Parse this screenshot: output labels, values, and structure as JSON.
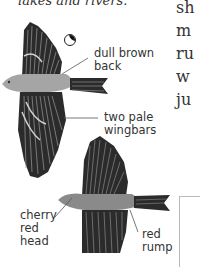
{
  "page": {
    "caption_fragment": "lakes and rivers.",
    "body_text_lines": [
      "sh",
      "m",
      "ru",
      "w",
      "ju"
    ]
  },
  "illustrations": [
    {
      "subject": "bird-in-flight-upper",
      "labels": [
        "dull brown back",
        "two pale wingbars"
      ],
      "icon": "moon-phase-icon"
    },
    {
      "subject": "bird-in-flight-lower",
      "labels": [
        "cherry red head",
        "red rump"
      ]
    }
  ],
  "labels": {
    "dull_brown_back": [
      "dull brown",
      "back"
    ],
    "two_pale_wingbars": [
      "two pale",
      "wingbars"
    ],
    "cherry_red_head": [
      "cherry",
      "red",
      "head"
    ],
    "red_rump": [
      "red",
      "rump"
    ]
  },
  "colors": {
    "wing_dark": "#2b2b2b",
    "body_gray": "#9a9a9a",
    "feather_light": "#c8c8c8",
    "text": "#333333"
  }
}
